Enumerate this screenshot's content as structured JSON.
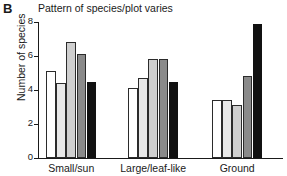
{
  "panel": {
    "letter": "B"
  },
  "chart_data": {
    "type": "bar",
    "title": "Pattern of species/plot varies",
    "xlabel": "",
    "ylabel": "Number of species",
    "ylim": [
      0,
      8
    ],
    "yticks": [
      0,
      2,
      4,
      6,
      8
    ],
    "ytick_labels": [
      "0",
      "2",
      "4",
      "6",
      "8"
    ],
    "grid": false,
    "legend": "none",
    "categories": [
      "Small/sun",
      "Large/leaf-like",
      "Ground"
    ],
    "series": [
      {
        "name": "series-1",
        "color": "#ffffff",
        "values": [
          5.1,
          4.1,
          3.4
        ]
      },
      {
        "name": "series-2",
        "color": "#e8e8e8",
        "values": [
          4.4,
          4.7,
          3.4
        ]
      },
      {
        "name": "series-3",
        "color": "#cfcfcf",
        "values": [
          6.8,
          5.8,
          3.1
        ]
      },
      {
        "name": "series-4",
        "color": "#8a8a8a",
        "values": [
          6.1,
          5.8,
          4.8
        ]
      },
      {
        "name": "series-5",
        "color": "#111111",
        "values": [
          4.5,
          4.5,
          7.9
        ]
      }
    ]
  }
}
